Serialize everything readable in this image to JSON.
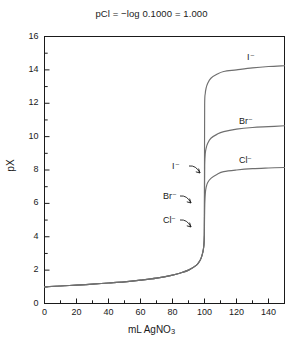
{
  "chart_data": {
    "type": "line",
    "title": "pCl = −log 0.1000 = 1.000",
    "xlabel": "mL AgNO3",
    "xlabel_base": "mL AgNO",
    "xlabel_sub": "3",
    "ylabel": "pX",
    "xlim": [
      0,
      150
    ],
    "ylim": [
      0,
      16
    ],
    "xticks": [
      0,
      20,
      40,
      60,
      80,
      100,
      120,
      140
    ],
    "xticklabels": [
      "0",
      "20",
      "40",
      "60",
      "80",
      "100",
      "120",
      "140"
    ],
    "xminorticks": [
      10,
      30,
      50,
      70,
      90,
      110,
      130,
      150
    ],
    "yticks": [
      0,
      2,
      4,
      6,
      8,
      10,
      12,
      14,
      16
    ],
    "yticklabels": [
      "0",
      "2",
      "4",
      "6",
      "8",
      "10",
      "12",
      "14",
      "16"
    ],
    "yminorticks": [
      1,
      3,
      5,
      7,
      9,
      11,
      13,
      15
    ],
    "grid": false,
    "legend": "inline-curve-labels",
    "frame": "box",
    "series": [
      {
        "name": "I−",
        "label": "I⁻",
        "color": "#6f6f6f",
        "equivalence_volume": 100,
        "points": [
          [
            0,
            1.0
          ],
          [
            10,
            1.05
          ],
          [
            20,
            1.1
          ],
          [
            30,
            1.16
          ],
          [
            40,
            1.23
          ],
          [
            50,
            1.3
          ],
          [
            60,
            1.4
          ],
          [
            70,
            1.52
          ],
          [
            80,
            1.7
          ],
          [
            85,
            1.83
          ],
          [
            90,
            2.0
          ],
          [
            95,
            2.3
          ],
          [
            97,
            2.55
          ],
          [
            98,
            2.75
          ],
          [
            99,
            3.1
          ],
          [
            99.5,
            3.4
          ],
          [
            99.9,
            4.1
          ],
          [
            100,
            8.05
          ],
          [
            100.1,
            11.9
          ],
          [
            100.5,
            12.6
          ],
          [
            101,
            12.9
          ],
          [
            102,
            13.2
          ],
          [
            104,
            13.5
          ],
          [
            108,
            13.75
          ],
          [
            112,
            13.9
          ],
          [
            120,
            14.0
          ],
          [
            130,
            14.12
          ],
          [
            140,
            14.2
          ],
          [
            150,
            14.25
          ]
        ]
      },
      {
        "name": "Br−",
        "label": "Br⁻",
        "color": "#6f6f6f",
        "equivalence_volume": 100,
        "points": [
          [
            0,
            1.0
          ],
          [
            10,
            1.05
          ],
          [
            20,
            1.1
          ],
          [
            30,
            1.16
          ],
          [
            40,
            1.23
          ],
          [
            50,
            1.3
          ],
          [
            60,
            1.4
          ],
          [
            70,
            1.52
          ],
          [
            80,
            1.7
          ],
          [
            85,
            1.83
          ],
          [
            90,
            2.0
          ],
          [
            95,
            2.3
          ],
          [
            97,
            2.55
          ],
          [
            98,
            2.75
          ],
          [
            99,
            3.1
          ],
          [
            99.5,
            3.4
          ],
          [
            99.9,
            4.1
          ],
          [
            100,
            6.3
          ],
          [
            100.1,
            8.3
          ],
          [
            100.5,
            9.0
          ],
          [
            101,
            9.3
          ],
          [
            102,
            9.6
          ],
          [
            104,
            9.9
          ],
          [
            108,
            10.15
          ],
          [
            112,
            10.3
          ],
          [
            120,
            10.45
          ],
          [
            130,
            10.55
          ],
          [
            140,
            10.6
          ],
          [
            150,
            10.65
          ]
        ]
      },
      {
        "name": "Cl−",
        "label": "Cl⁻",
        "color": "#6f6f6f",
        "equivalence_volume": 100,
        "points": [
          [
            0,
            1.0
          ],
          [
            10,
            1.05
          ],
          [
            20,
            1.1
          ],
          [
            30,
            1.16
          ],
          [
            40,
            1.23
          ],
          [
            50,
            1.3
          ],
          [
            60,
            1.4
          ],
          [
            70,
            1.52
          ],
          [
            80,
            1.7
          ],
          [
            85,
            1.83
          ],
          [
            90,
            2.0
          ],
          [
            95,
            2.3
          ],
          [
            97,
            2.55
          ],
          [
            98,
            2.75
          ],
          [
            99,
            3.1
          ],
          [
            99.5,
            3.4
          ],
          [
            99.9,
            4.1
          ],
          [
            100,
            5.0
          ],
          [
            100.2,
            6.1
          ],
          [
            100.6,
            6.7
          ],
          [
            101,
            6.95
          ],
          [
            102,
            7.25
          ],
          [
            104,
            7.5
          ],
          [
            108,
            7.75
          ],
          [
            112,
            7.9
          ],
          [
            120,
            8.0
          ],
          [
            130,
            8.08
          ],
          [
            140,
            8.12
          ],
          [
            150,
            8.15
          ]
        ]
      }
    ],
    "annotations": [
      {
        "text": "I⁻",
        "x": 247,
        "y": 52,
        "kind": "curve-end-label",
        "for": "I−"
      },
      {
        "text": "Br⁻",
        "x": 239,
        "y": 116,
        "kind": "curve-end-label",
        "for": "Br−"
      },
      {
        "text": "Cl⁻",
        "x": 239,
        "y": 155,
        "kind": "curve-end-label",
        "for": "Cl−"
      },
      {
        "text": "I⁻",
        "x": 172,
        "y": 161,
        "kind": "arrow-label",
        "for": "I−"
      },
      {
        "text": "Br⁻",
        "x": 163,
        "y": 191,
        "kind": "arrow-label",
        "for": "Br−"
      },
      {
        "text": "Cl⁻",
        "x": 163,
        "y": 215,
        "kind": "arrow-label",
        "for": "Cl−"
      }
    ]
  },
  "colors": {
    "axis": "#1a1a1a",
    "curve": "#6f6f6f",
    "background": "#ffffff",
    "text": "#1a1a1a"
  }
}
